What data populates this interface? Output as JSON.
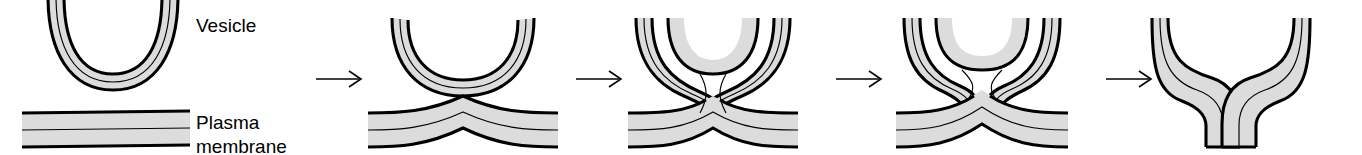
{
  "figure": {
    "width": 1362,
    "height": 155,
    "background_color": "#ffffff",
    "membrane_fill_color": "#dcdcdc",
    "outline_color": "#000000",
    "midline_color": "#000000"
  },
  "labels": [
    {
      "id": "vesicle",
      "text": "Vesicle",
      "x": 196,
      "y": 32
    },
    {
      "id": "plasma",
      "text": "Plasma",
      "x": 196,
      "y": 129
    },
    {
      "id": "membrane",
      "text": "membrane",
      "x": 196,
      "y": 153
    }
  ],
  "arrows": [
    {
      "id": "arrow-1",
      "x1": 316,
      "x2": 361,
      "y": 79
    },
    {
      "id": "arrow-2",
      "x1": 576,
      "x2": 621,
      "y": 79
    },
    {
      "id": "arrow-3",
      "x1": 836,
      "x2": 881,
      "y": 79
    },
    {
      "id": "arrow-4",
      "x1": 1106,
      "x2": 1151,
      "y": 79
    }
  ],
  "stages": [
    {
      "id": "stage-1",
      "index": 1,
      "name": "docking",
      "description": "Vesicle bilayer approaches the flat plasma membrane bilayer"
    },
    {
      "id": "stage-2",
      "index": 2,
      "name": "contact",
      "description": "Vesicle touches the plasma membrane which bulges upward at the contact point"
    },
    {
      "id": "stage-3",
      "index": 3,
      "name": "hemifusion",
      "description": "Outer leaflets merge forming an hourglass stalk between vesicle and membrane"
    },
    {
      "id": "stage-4",
      "index": 4,
      "name": "fusion-pore",
      "description": "A fusion pore opens through the merged bilayers"
    },
    {
      "id": "stage-5",
      "index": 5,
      "name": "pore-expansion",
      "description": "Pore widens; vesicle membrane becomes continuous with the plasma membrane"
    }
  ]
}
